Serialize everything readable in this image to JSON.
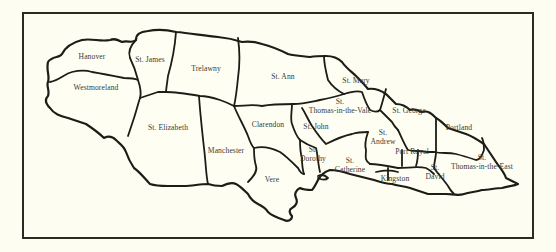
{
  "map": {
    "subject": "Parishes of Jamaica",
    "parishes": [
      {
        "name": "Hanover",
        "line1": "Hanover",
        "line2": ""
      },
      {
        "name": "St. James",
        "line1": "St. James",
        "line2": ""
      },
      {
        "name": "Trelawny",
        "line1": "Trelawny",
        "line2": ""
      },
      {
        "name": "St. Ann",
        "line1": "St. Ann",
        "line2": ""
      },
      {
        "name": "St. Mary",
        "line1": "St. Mary",
        "line2": ""
      },
      {
        "name": "Westmoreland",
        "line1": "Westmoreland",
        "line2": ""
      },
      {
        "name": "St. Elizabeth",
        "line1": "St. Elizabeth",
        "line2": ""
      },
      {
        "name": "Manchester",
        "line1": "Manchester",
        "line2": ""
      },
      {
        "name": "Clarendon",
        "line1": "Clarendon",
        "line2": ""
      },
      {
        "name": "St. John",
        "line1": "St. John",
        "line2": ""
      },
      {
        "name": "St. Thomas-in-the-Vale",
        "line1": "St.",
        "line2": "Thomas-in-the-Vale"
      },
      {
        "name": "St. George",
        "line1": "St. George",
        "line2": ""
      },
      {
        "name": "Portland",
        "line1": "Portland",
        "line2": ""
      },
      {
        "name": "St. Andrew",
        "line1": "St.",
        "line2": "Andrew"
      },
      {
        "name": "Port Royal",
        "line1": "Port Royal",
        "line2": ""
      },
      {
        "name": "St. Dorothy",
        "line1": "St.",
        "line2": "Dorothy"
      },
      {
        "name": "St. Catherine",
        "line1": "St.",
        "line2": "Catherine"
      },
      {
        "name": "Vere",
        "line1": "Vere",
        "line2": ""
      },
      {
        "name": "Kingston",
        "line1": "Kingston",
        "line2": ""
      },
      {
        "name": "St. David",
        "line1": "St.",
        "line2": "David"
      },
      {
        "name": "St. Thomas-in-the-East",
        "line1": "St.",
        "line2": "Thomas-in-the-East"
      }
    ]
  }
}
